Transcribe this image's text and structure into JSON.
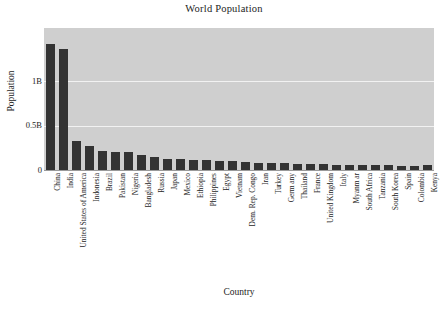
{
  "chart_data": {
    "type": "bar",
    "title": "World Population",
    "xlabel": "Country",
    "ylabel": "Population",
    "ylim": [
      0,
      1600000000
    ],
    "grid": true,
    "legend": false,
    "y_ticks": [
      {
        "label": "0",
        "value": 0
      },
      {
        "label": "0.5B",
        "value": 500000000
      },
      {
        "label": "1B",
        "value": 1000000000
      }
    ],
    "categories": [
      "China",
      "India",
      "United States of America",
      "Indonesia",
      "Brazil",
      "Pakistan",
      "Nigeria",
      "Bangladesh",
      "Russia",
      "Japan",
      "Mexico",
      "Ethiopia",
      "Philippines",
      "Egypt",
      "Vietnam",
      "Dem. Rep. Congo",
      "Iran",
      "Turkey",
      "Germ any",
      "Thailand",
      "France",
      "United Kingdom",
      "Italy",
      "Myanm ar",
      "South Africa",
      "Tanzania",
      "South Korea",
      "Spain",
      "Colombia",
      "Kenya"
    ],
    "values": [
      1420000000,
      1360000000,
      329000000,
      269000000,
      212000000,
      204000000,
      200000000,
      168000000,
      144000000,
      126000000,
      127000000,
      112000000,
      108000000,
      101000000,
      97000000,
      87000000,
      83000000,
      82000000,
      83000000,
      69000000,
      65000000,
      67000000,
      60000000,
      54000000,
      58000000,
      58000000,
      51000000,
      47000000,
      50000000,
      52000000
    ],
    "bar_color": "#333333",
    "plot_background": "#cfcfcf",
    "gridline_color": "#f2f2f2",
    "figure_background": "#ffffff"
  }
}
